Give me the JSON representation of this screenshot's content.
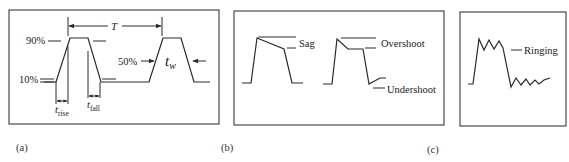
{
  "figure": {
    "colors": {
      "line": "#2a2a2a",
      "frame": "#3a3a3a",
      "text": "#222222",
      "background": "#ffffff"
    },
    "panels": [
      {
        "id": "a",
        "caption": "(a)",
        "frame": {
          "x": 9,
          "y": 10,
          "w": 210,
          "h": 114
        },
        "labels": {
          "level_high": "90%",
          "level_low": "10%",
          "level_mid": "50%",
          "period": "T",
          "pulse_width": "t",
          "pulse_width_sub": "w",
          "rise_time": "t",
          "rise_time_sub": "rise",
          "fall_time": "t",
          "fall_time_sub": "fall"
        },
        "waveform": "44,82 56,82 70,38 88,38 101,82 149,82 163,38 181,38 194,82 210,82"
      },
      {
        "id": "b",
        "caption": "(b)",
        "frame": {
          "x": 234,
          "y": 11,
          "w": 210,
          "h": 114
        },
        "labels": {
          "sag": "Sag",
          "overshoot": "Overshoot",
          "undershoot": "Undershoot"
        },
        "waveform_sag": "242,83 251,83 257,38 284,49 292,83 303,83",
        "waveform_overshoot": "323,84 332,84 337,39 348,49 363,49 369,84 380,78 386,78"
      },
      {
        "id": "c",
        "caption": "(c)",
        "frame": {
          "x": 460,
          "y": 12,
          "w": 106,
          "h": 114
        },
        "labels": {
          "ringing": "Ringing"
        },
        "waveform_ringing": "468,84 473,84 479,39 484,50 489,40 494,49 499,41 503,48 511,87 516,78 521,85 526,79 530,85 535,80 539,84 544,80 550,78"
      }
    ]
  }
}
